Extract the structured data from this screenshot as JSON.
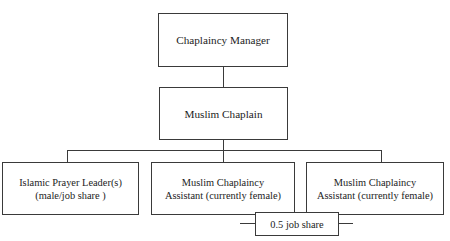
{
  "diagram": {
    "type": "organisational-chart",
    "orientation": "top-down",
    "style": {
      "background": "#ffffff",
      "box_fill": "#ffffff",
      "box_border": "#3a3a3a",
      "connector_color": "#3a3a3a",
      "text_color": "#1c1c1c"
    },
    "nodes": {
      "manager": {
        "id": "chaplaincy-manager",
        "level": 1,
        "lines": [
          "Chaplaincy Manager"
        ]
      },
      "chaplain": {
        "id": "muslim-chaplain",
        "level": 2,
        "lines": [
          "Muslim Chaplain"
        ]
      },
      "prayer_leader": {
        "id": "islamic-prayer-leader",
        "level": 3,
        "lines": [
          "Islamic Prayer Leader(s)",
          "(male/job share )"
        ]
      },
      "assistant_1": {
        "id": "muslim-chaplaincy-assistant-1",
        "level": 3,
        "lines": [
          "Muslim Chaplaincy",
          "Assistant (currently female)"
        ]
      },
      "assistant_2": {
        "id": "muslim-chaplaincy-assistant-2",
        "level": 3,
        "lines": [
          "Muslim Chaplaincy",
          "Assistant (currently female)"
        ]
      },
      "job_share_note": {
        "id": "job-share-annotation",
        "level": 4,
        "lines": [
          "0.5 job share"
        ]
      }
    },
    "edges": [
      {
        "from": "chaplaincy-manager",
        "to": "muslim-chaplain"
      },
      {
        "from": "muslim-chaplain",
        "to": "islamic-prayer-leader"
      },
      {
        "from": "muslim-chaplain",
        "to": "muslim-chaplaincy-assistant-1"
      },
      {
        "from": "muslim-chaplain",
        "to": "muslim-chaplaincy-assistant-2"
      },
      {
        "from": "muslim-chaplaincy-assistant-1",
        "to": "job-share-annotation"
      },
      {
        "from": "muslim-chaplaincy-assistant-2",
        "to": "job-share-annotation"
      }
    ]
  }
}
